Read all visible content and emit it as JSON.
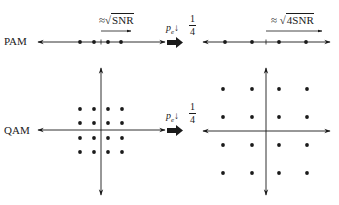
{
  "diagram": {
    "rows": [
      {
        "label": "PAM",
        "before": {
          "annotation": "≈",
          "annotation_radicand": "SNR",
          "points_x": [
            80,
            94,
            108,
            121
          ],
          "axis_y": 42,
          "axis_x": [
            38,
            165
          ],
          "center_tick_x": 101
        },
        "transition": {
          "symbol": "p",
          "subscript": "e",
          "arrow": "↓",
          "fraction_num": "1",
          "fraction_den": "4"
        },
        "after": {
          "annotation": "≈",
          "annotation_radicand": "4SNR",
          "points_x": [
            225,
            252,
            279,
            306
          ],
          "axis_y": 42,
          "axis_x": [
            203,
            330
          ],
          "center_tick_x": 266
        }
      },
      {
        "label": "QAM",
        "before": {
          "grid_x": [
            80,
            94,
            108,
            122
          ],
          "grid_y": [
            109,
            123,
            138,
            152
          ],
          "axis_h_y": 130,
          "axis_h_x": [
            38,
            165
          ],
          "axis_v_x": 101,
          "axis_v_y": [
            68,
            195
          ]
        },
        "transition": {
          "symbol": "p",
          "subscript": "e",
          "arrow": "↓",
          "fraction_num": "1",
          "fraction_den": "4"
        },
        "after": {
          "grid_x": [
            223,
            252,
            279,
            307
          ],
          "grid_y": [
            89,
            117,
            145,
            173
          ],
          "axis_h_y": 131,
          "axis_h_x": [
            203,
            330
          ],
          "axis_v_x": 266,
          "axis_v_y": [
            68,
            195
          ]
        }
      }
    ],
    "colors": {
      "ink": "#1a1a1a",
      "background": "#ffffff"
    }
  }
}
